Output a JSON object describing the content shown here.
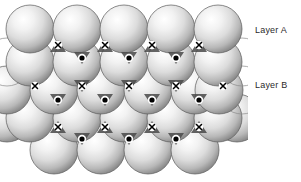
{
  "figure": {
    "background_color": "#ffffff",
    "width": 301,
    "height": 182,
    "sphere_radius": 24,
    "sphere_fill_light": "#ffffff",
    "sphere_fill_mid": "#d6d6d6",
    "sphere_fill_dark": "#8e8e8e",
    "outline_color": "#5a5a5a",
    "marker_color": "#000000"
  },
  "labels": {
    "layer_a": "Layer A",
    "layer_b": "Layer B"
  },
  "markers": {
    "x_symbol": "x",
    "dot_symbol": "•",
    "x_meaning": "tetrahedral-site-marker",
    "dot_meaning": "octahedral-site-marker",
    "x_count": 16,
    "dot_count": 15
  },
  "sphere_rows": [
    {
      "name": "row-1-layer-a",
      "layer": "A",
      "cy": 29,
      "count": 5,
      "filled": true,
      "cx": [
        30,
        77,
        124,
        171,
        218
      ]
    },
    {
      "name": "row-2-layer-b",
      "layer": "B",
      "cy": 62,
      "count": 4,
      "filled": true,
      "cx": [
        54,
        101,
        148,
        195
      ]
    },
    {
      "name": "row-3-layer-a",
      "layer": "A",
      "cy": 90,
      "count": 5,
      "filled": true,
      "cx": [
        30,
        77,
        124,
        171,
        218
      ],
      "outline_only_cx": [
        -10,
        242
      ]
    },
    {
      "name": "row-4-layer-b",
      "layer": "B",
      "cy": 118,
      "count": 5,
      "filled": true,
      "cx": [
        7,
        54,
        101,
        148,
        195,
        237
      ]
    },
    {
      "name": "row-5-layer-a",
      "layer": "A",
      "cy": 150,
      "count": 4,
      "filled": true,
      "cx": [
        54,
        101,
        148,
        195
      ]
    }
  ],
  "x_markers": [
    {
      "x": 58,
      "y": 43
    },
    {
      "x": 105,
      "y": 43
    },
    {
      "x": 152,
      "y": 43
    },
    {
      "x": 199,
      "y": 43
    },
    {
      "x": 82,
      "y": 86
    },
    {
      "x": 129,
      "y": 86
    },
    {
      "x": 176,
      "y": 86
    },
    {
      "x": 58,
      "y": 125
    },
    {
      "x": 105,
      "y": 125
    },
    {
      "x": 152,
      "y": 125
    },
    {
      "x": 199,
      "y": 125
    },
    {
      "x": 35,
      "y": 86
    },
    {
      "x": 223,
      "y": 86
    }
  ],
  "dot_markers": [
    {
      "x": 82,
      "y": 57
    },
    {
      "x": 129,
      "y": 57
    },
    {
      "x": 176,
      "y": 57
    },
    {
      "x": 58,
      "y": 99
    },
    {
      "x": 105,
      "y": 99
    },
    {
      "x": 152,
      "y": 99
    },
    {
      "x": 199,
      "y": 99
    },
    {
      "x": 82,
      "y": 138
    },
    {
      "x": 129,
      "y": 138
    },
    {
      "x": 176,
      "y": 138
    }
  ]
}
